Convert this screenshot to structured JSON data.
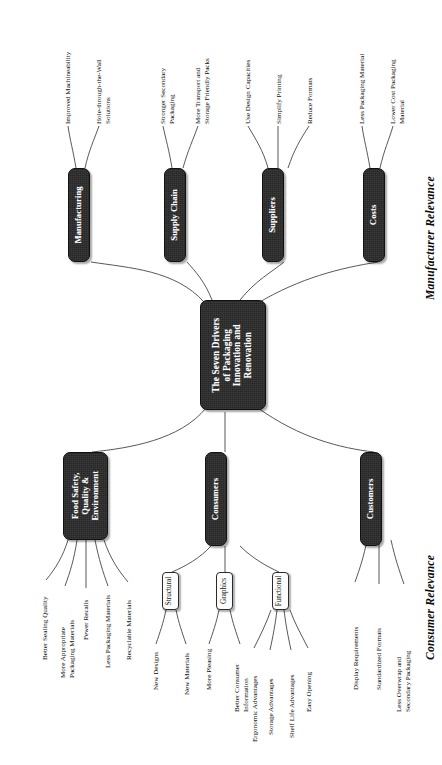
{
  "diagram": {
    "title": "The Seven Drivers of Packaging Innovation and Renovation",
    "orientation": "rotated-90-ccw",
    "background": "#ffffff",
    "node_fill": "#262626",
    "node_text": "#ffffff",
    "subnode_fill": "#fdfdfd",
    "edge_color": "#3a3a3a"
  },
  "central": {
    "label": "The Seven Drivers\nof Packaging\nInnovation and\nRenovation"
  },
  "captions": {
    "manufacturer": "Manufacturer Relevance",
    "consumer": "Consumer Relevance"
  },
  "branches": [
    {
      "id": "manufacturing",
      "label": "Manufacturing",
      "side": "manufacturer",
      "leaves": [
        "Improved Machineability",
        "Hole-through-the-Wall\nSolutions"
      ]
    },
    {
      "id": "supply-chain",
      "label": "Supply Chain",
      "side": "manufacturer",
      "leaves": [
        "Stronger Secondary\nPackaging",
        "More Transport and\nStorage Friendly Packs"
      ]
    },
    {
      "id": "suppliers",
      "label": "Suppliers",
      "side": "manufacturer",
      "leaves": [
        "Use Design Capacities",
        "Simplify Printing",
        "Reduce Formats"
      ]
    },
    {
      "id": "costs",
      "label": "Costs",
      "side": "manufacturer",
      "leaves": [
        "Less Packaging Material",
        "Lower Cost Packaging\nMaterial"
      ]
    },
    {
      "id": "food-safety",
      "label": "Food Safety,\nQuality &\nEnvironment",
      "side": "consumer",
      "leaves": [
        "Better Sealing Quality",
        "More Appropriate\nPackaging Materials",
        "Fewer Recalls",
        "Less Packaging Materials",
        "Recyclable Materials"
      ]
    },
    {
      "id": "consumers",
      "label": "Consumers",
      "side": "consumer",
      "subnodes": [
        {
          "id": "structural",
          "label": "Structural",
          "leaves": [
            "New Designs",
            "New Materials"
          ]
        },
        {
          "id": "graphics",
          "label": "Graphics",
          "leaves": [
            "More Pleasing",
            "Better Consumer\nInformation"
          ]
        },
        {
          "id": "functional",
          "label": "Functional",
          "leaves": [
            "Ergonomic Advantages",
            "Storage Advantages",
            "Shelf Life Advantages",
            "Easy Opening"
          ]
        }
      ]
    },
    {
      "id": "customers",
      "label": "Customers",
      "side": "consumer",
      "leaves": [
        "Display Requirements",
        "Standardized Formats",
        "Less Overwrap and\nSecondary Packaging"
      ]
    }
  ]
}
